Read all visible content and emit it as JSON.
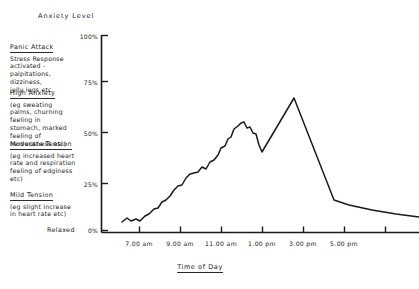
{
  "chart_data": {
    "type": "line",
    "title": "Anxiety Level",
    "xlabel": "Time of Day",
    "ylabel": "Anxiety Level",
    "grid": false,
    "legend": null,
    "ylim": [
      0,
      100
    ],
    "ytick_labels": [
      "100%",
      "75%",
      "50%",
      "25%",
      "0%"
    ],
    "ytick_values": [
      100,
      75,
      50,
      25,
      0
    ],
    "xtick_labels": [
      "7.00 am",
      "9.00 am",
      "11.00 am",
      "1.00 pm",
      "3.00 pm",
      "5.00 pm"
    ],
    "x": [
      "7.00 am",
      "8.00 am",
      "9.00 am",
      "10.00 am",
      "11.00 am",
      "12.00 pm",
      "1.00 pm",
      "2.00 pm",
      "3.00 pm",
      "4.00 pm",
      "5.00 pm",
      "6.00 pm"
    ],
    "values": [
      5,
      12,
      22,
      38,
      55,
      50,
      38,
      72,
      30,
      14,
      12,
      10
    ],
    "points": [
      [
        122,
        222
      ],
      [
        127,
        218
      ],
      [
        131,
        221
      ],
      [
        136,
        219
      ],
      [
        140,
        221
      ],
      [
        145,
        216
      ],
      [
        149,
        214
      ],
      [
        154,
        209
      ],
      [
        158,
        208
      ],
      [
        162,
        202
      ],
      [
        166,
        200
      ],
      [
        170,
        196
      ],
      [
        174,
        190
      ],
      [
        178,
        186
      ],
      [
        182,
        185
      ],
      [
        186,
        178
      ],
      [
        190,
        174
      ],
      [
        194,
        173
      ],
      [
        198,
        172
      ],
      [
        202,
        167
      ],
      [
        206,
        169
      ],
      [
        210,
        162
      ],
      [
        214,
        160
      ],
      [
        218,
        155
      ],
      [
        221,
        148
      ],
      [
        225,
        146
      ],
      [
        228,
        139
      ],
      [
        231,
        137
      ],
      [
        234,
        129
      ],
      [
        238,
        126
      ],
      [
        241,
        123
      ],
      [
        244,
        122
      ],
      [
        247,
        128
      ],
      [
        250,
        127
      ],
      [
        253,
        133
      ],
      [
        256,
        134
      ],
      [
        259,
        145
      ],
      [
        262,
        152
      ],
      [
        294,
        98
      ],
      [
        334,
        200
      ],
      [
        349,
        205
      ],
      [
        372,
        210
      ],
      [
        396,
        214
      ],
      [
        419,
        217
      ]
    ]
  },
  "bands": [
    {
      "heading": "Panic Attack",
      "lines": [
        "Stress Response",
        "activated -",
        "palpitations,",
        "dizziness,",
        "jelly legs etc."
      ]
    },
    {
      "heading": "High Anxiety",
      "lines": [
        "(eg sweating",
        "palms, churning",
        "feeling in",
        "stomach, marked",
        "feeling of",
        "nervousness etc)"
      ]
    },
    {
      "heading": "Moderate Tension",
      "lines": [
        "(eg increased heart",
        "rate and respiration",
        "feeling of edginess",
        "etc)"
      ]
    },
    {
      "heading": "Mild Tension",
      "lines": [
        "(eg slight increase",
        "in heart rate etc)"
      ]
    }
  ],
  "relaxed_label": "Relaxed",
  "colors": {
    "line": "#1a1a1a",
    "axis": "#1a1a1a",
    "background": "#ffffff"
  }
}
